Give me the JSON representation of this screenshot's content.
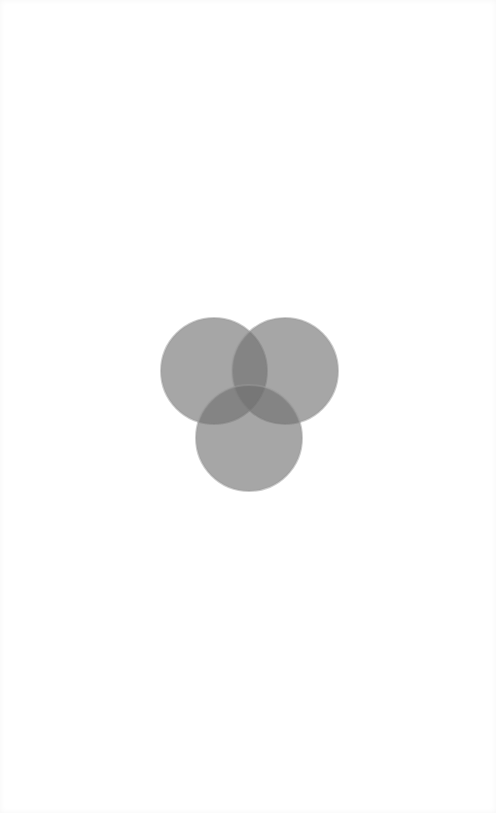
{
  "diagram": {
    "type": "venn",
    "circle_count": 3,
    "background": "#ffffff",
    "fill_color": "#6f6f6f",
    "fill_opacity": 0.8,
    "stroke_color": "#9a9a9a",
    "circles": [
      {
        "name": "top-left",
        "cx": 214,
        "cy": 371,
        "r": 53
      },
      {
        "name": "top-right",
        "cx": 285,
        "cy": 371,
        "r": 53
      },
      {
        "name": "bottom",
        "cx": 249,
        "cy": 438,
        "r": 53
      }
    ],
    "labels": []
  }
}
